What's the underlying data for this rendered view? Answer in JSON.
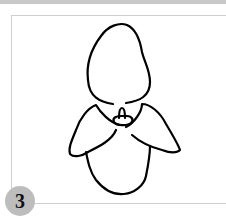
{
  "figure": {
    "label_number": "3",
    "subject_icon": "flower-outline-icon",
    "colors": {
      "stroke": "#000000",
      "badge": "#bdbdbd",
      "frame_border": "#cfcfcf",
      "top_strip": "#c8c8c8"
    }
  }
}
